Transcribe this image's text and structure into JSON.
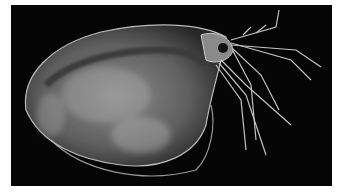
{
  "image": {
    "subject": "water flea (Daphnia) micrograph",
    "background_color": "#050505",
    "frame_color": "#ffffff"
  }
}
